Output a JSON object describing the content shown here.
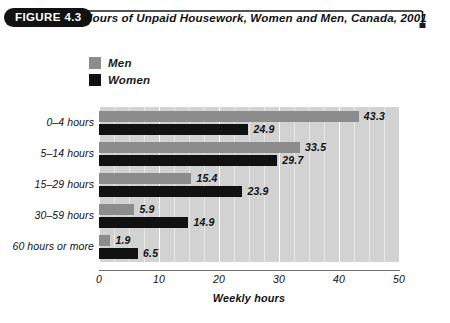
{
  "header": {
    "badge": "FIGURE 4.3",
    "title": "Hours of Unpaid Housework, Women and Men, Canada, 2001"
  },
  "legend": {
    "items": [
      {
        "label": "Men",
        "color": "#8c8c8c",
        "name": "legend-item-men"
      },
      {
        "label": "Women",
        "color": "#111111",
        "name": "legend-item-women"
      }
    ]
  },
  "axis": {
    "x_title": "Weekly hours",
    "x_ticks": [
      "0",
      "10",
      "20",
      "30",
      "40",
      "50"
    ]
  },
  "chart_data": {
    "type": "bar",
    "orientation": "horizontal",
    "title": "Hours of Unpaid Housework, Women and Men, Canada, 2001",
    "xlabel": "Weekly hours",
    "ylabel": "",
    "xlim": [
      0,
      50
    ],
    "xticks": [
      0,
      10,
      20,
      30,
      40,
      50
    ],
    "grid": true,
    "grid_axis": "x",
    "grid_step": 2.5,
    "legend_position": "top-left",
    "categories": [
      "0–4 hours",
      "5–14 hours",
      "15–29 hours",
      "30–59 hours",
      "60 hours or more"
    ],
    "series": [
      {
        "name": "Men",
        "color": "#8c8c8c",
        "values": [
          43.3,
          33.5,
          15.4,
          5.9,
          1.9
        ],
        "labels": [
          "43.3",
          "33.5",
          "15.4",
          "5.9",
          "1.9"
        ]
      },
      {
        "name": "Women",
        "color": "#111111",
        "values": [
          24.9,
          29.7,
          23.9,
          14.9,
          6.5
        ],
        "labels": [
          "24.9",
          "29.7",
          "23.9",
          "14.9",
          "6.5"
        ]
      }
    ]
  }
}
